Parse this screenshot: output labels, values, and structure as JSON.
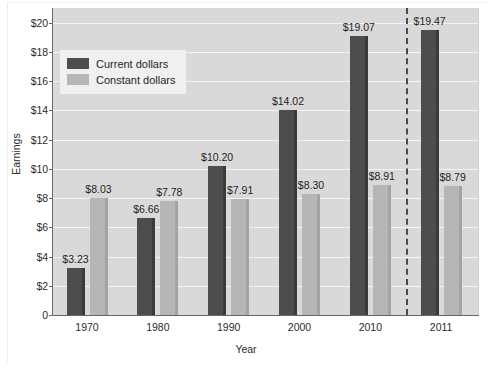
{
  "chart_data": {
    "type": "bar",
    "title": "",
    "xlabel": "Year",
    "ylabel": "Earnings",
    "categories": [
      "1970",
      "1980",
      "1990",
      "2000",
      "2010",
      "2011"
    ],
    "series": [
      {
        "name": "Current dollars",
        "values": [
          3.23,
          6.66,
          10.2,
          14.02,
          19.07,
          19.47
        ],
        "labels": [
          "$3.23",
          "$6.66",
          "$10.20",
          "$14.02",
          "$19.07",
          "$19.47"
        ],
        "color": "#4d4d4d"
      },
      {
        "name": "Constant dollars",
        "values": [
          8.03,
          7.78,
          7.91,
          8.3,
          8.91,
          8.79
        ],
        "labels": [
          "$8.03",
          "$7.78",
          "$7.91",
          "$8.30",
          "$8.91",
          "$8.79"
        ],
        "color": "#b6b6b6"
      }
    ],
    "ylim": [
      0,
      21
    ],
    "yticks": [
      0,
      2,
      4,
      6,
      8,
      10,
      12,
      14,
      16,
      18,
      20
    ],
    "ytick_labels": [
      "0",
      "$2",
      "$4",
      "$6",
      "$8",
      "$10",
      "$12",
      "$14",
      "$16",
      "$18",
      "$20"
    ],
    "grid": "horizontal-white",
    "legend_position": "upper-left-inside",
    "annotations": [
      {
        "type": "vertical-dashed-line",
        "between": [
          "2010",
          "2011"
        ]
      }
    ],
    "plot_background": "#d9d9d9",
    "figure_background": "#ffffff"
  },
  "legend": {
    "items": [
      {
        "label": "Current dollars",
        "swatch": "dark"
      },
      {
        "label": "Constant dollars",
        "swatch": "light"
      }
    ]
  },
  "axes": {
    "y_title": "Earnings",
    "x_title": "Year"
  }
}
